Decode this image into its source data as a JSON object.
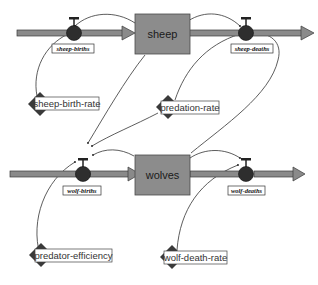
{
  "diagram": {
    "type": "stock-and-flow",
    "colors": {
      "pipe_fill": "#8a8a8a",
      "pipe_stroke": "#3a3a3a",
      "stock_fill": "#8c8c8c",
      "stock_stroke": "#4a4a4a",
      "valve_fill": "#2e2e2e",
      "aux_fill": "#3a3a3a",
      "connector": "#333333",
      "label_bg": "#ffffff"
    },
    "stocks": [
      {
        "id": "sheep",
        "label": "sheep"
      },
      {
        "id": "wolves",
        "label": "wolves"
      }
    ],
    "flows": [
      {
        "id": "sheep-births",
        "label": "sheep-births",
        "into": "sheep"
      },
      {
        "id": "sheep-deaths",
        "label": "sheep-deaths",
        "from": "sheep"
      },
      {
        "id": "wolf-births",
        "label": "wolf-births",
        "into": "wolves"
      },
      {
        "id": "wolf-deaths",
        "label": "wolf-deaths",
        "from": "wolves"
      }
    ],
    "variables": [
      {
        "id": "sheep-birth-rate",
        "label": "sheep-birth-rate"
      },
      {
        "id": "predation-rate",
        "label": "predation-rate"
      },
      {
        "id": "predator-efficiency",
        "label": "predator-efficiency"
      },
      {
        "id": "wolf-death-rate",
        "label": "wolf-death-rate"
      }
    ],
    "links": [
      {
        "from": "sheep",
        "to": "sheep-births"
      },
      {
        "from": "sheep-birth-rate",
        "to": "sheep-births"
      },
      {
        "from": "sheep",
        "to": "sheep-deaths"
      },
      {
        "from": "predation-rate",
        "to": "sheep-deaths"
      },
      {
        "from": "wolves",
        "to": "sheep-deaths"
      },
      {
        "from": "sheep",
        "to": "wolf-births"
      },
      {
        "from": "predation-rate",
        "to": "wolf-births"
      },
      {
        "from": "wolves",
        "to": "wolf-births"
      },
      {
        "from": "predator-efficiency",
        "to": "wolf-births"
      },
      {
        "from": "wolves",
        "to": "wolf-deaths"
      },
      {
        "from": "wolf-death-rate",
        "to": "wolf-deaths"
      }
    ]
  }
}
